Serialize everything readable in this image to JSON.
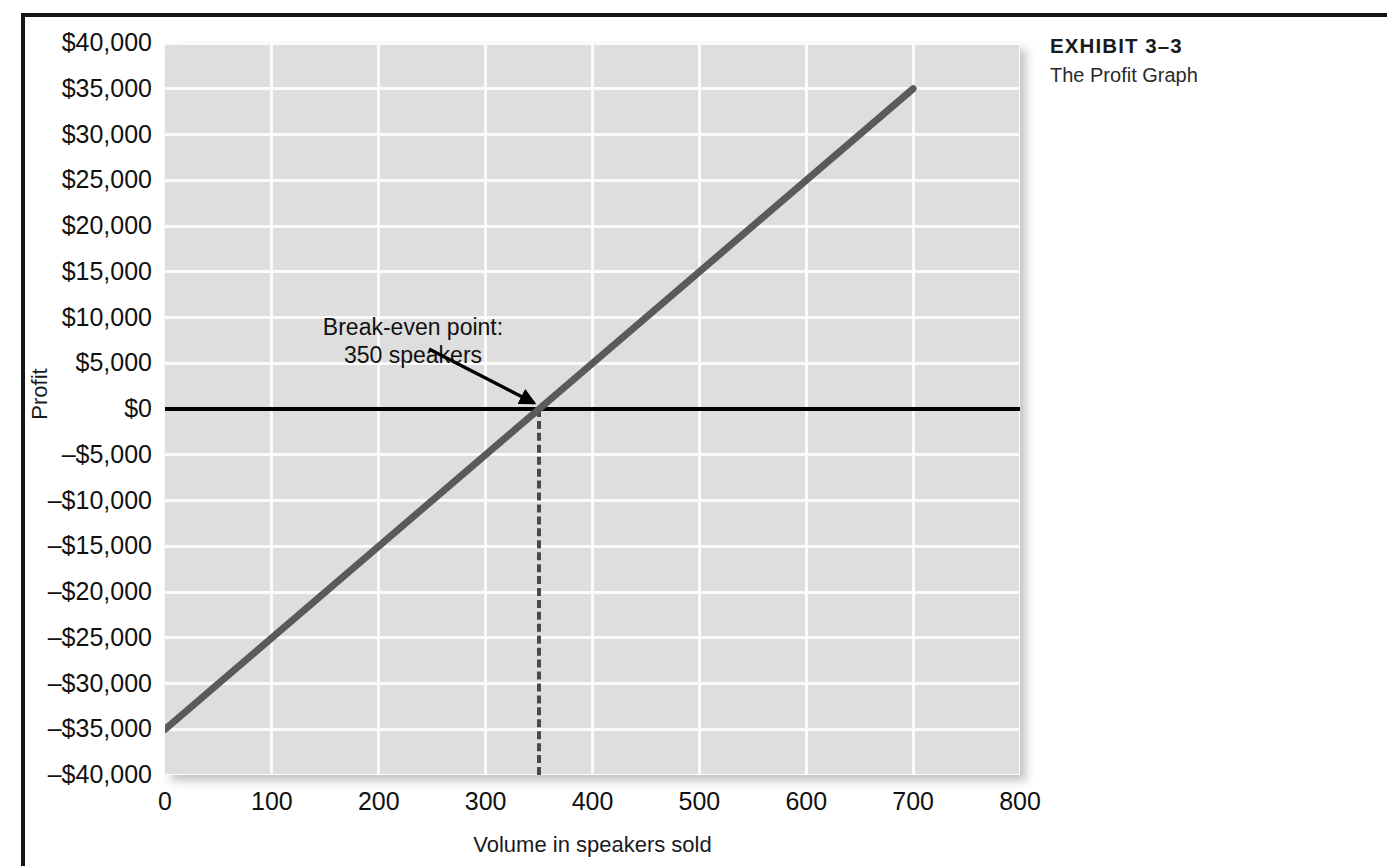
{
  "exhibit": {
    "number": "EXHIBIT 3–3",
    "subtitle": "The Profit Graph"
  },
  "chart_data": {
    "type": "line",
    "title": "The Profit Graph",
    "xlabel": "Volume in speakers sold",
    "ylabel": "Profit",
    "xlim": [
      0,
      800
    ],
    "ylim": [
      -40000,
      40000
    ],
    "grid": true,
    "legend": null,
    "x_ticks": [
      0,
      100,
      200,
      300,
      400,
      500,
      600,
      700,
      800
    ],
    "x_tick_labels": [
      "0",
      "100",
      "200",
      "300",
      "400",
      "500",
      "600",
      "700",
      "800"
    ],
    "y_ticks": [
      40000,
      35000,
      30000,
      25000,
      20000,
      15000,
      10000,
      5000,
      0,
      -5000,
      -10000,
      -15000,
      -20000,
      -25000,
      -30000,
      -35000,
      -40000
    ],
    "y_tick_labels": [
      "$40,000",
      "$35,000",
      "$30,000",
      "$25,000",
      "$20,000",
      "$15,000",
      "$10,000",
      "$5,000",
      "$0",
      "–$5,000",
      "–$10,000",
      "–$15,000",
      "–$20,000",
      "–$25,000",
      "–$30,000",
      "–$35,000",
      "–$40,000"
    ],
    "series": [
      {
        "name": "Profit",
        "color": "#5a5a5a",
        "x": [
          0,
          700
        ],
        "values": [
          -35000,
          35000
        ]
      }
    ],
    "reference_lines": [
      {
        "name": "zero-profit-axis",
        "orientation": "horizontal",
        "value": 0,
        "style": "solid",
        "color": "#000000"
      },
      {
        "name": "break-even-dropline",
        "orientation": "vertical",
        "value": 350,
        "style": "dashed",
        "color": "#4a4a4a"
      }
    ],
    "annotations": [
      {
        "name": "break-even-point",
        "line1": "Break-even point:",
        "line2": "350 speakers",
        "points_to_x": 350,
        "points_to_y": 0
      }
    ]
  }
}
